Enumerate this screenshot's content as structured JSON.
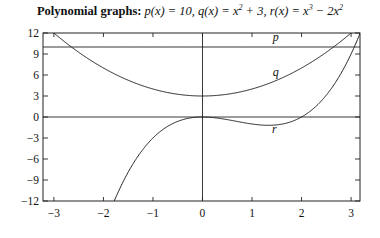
{
  "chart_data": {
    "type": "line",
    "title_bold": "Polynomial graphs:",
    "title_math": "p(x) = 10, q(x) = x² + 3, r(x) = x³ − 2x²",
    "xlabel": "",
    "ylabel": "",
    "xlim": [
      -3.22,
      3.18
    ],
    "ylim": [
      -12,
      12
    ],
    "xticks": [
      -3,
      -2,
      -1,
      0,
      1,
      2,
      3
    ],
    "xtick_labels": [
      "−3",
      "−2",
      "−1",
      "0",
      "1",
      "2",
      "3"
    ],
    "yticks": [
      12,
      9,
      6,
      3,
      0,
      -3,
      -6,
      -9,
      -12
    ],
    "ytick_labels": [
      "12",
      "9",
      "6",
      "3",
      "0",
      "−3",
      "−6",
      "−9",
      "−12"
    ],
    "grid": false,
    "axes_lines": {
      "x0": true,
      "y0": true
    },
    "series": [
      {
        "name": "p",
        "expr": "10",
        "coeffs": [
          10
        ],
        "label_at": [
          1.48,
          10.8
        ]
      },
      {
        "name": "q",
        "expr": "x^2 + 3",
        "coeffs": [
          3,
          0,
          1
        ],
        "label_at": [
          1.48,
          5.8
        ]
      },
      {
        "name": "r",
        "expr": "x^3 - 2x^2",
        "coeffs": [
          0,
          0,
          -2,
          1
        ],
        "label_at": [
          1.45,
          -2.3
        ]
      }
    ],
    "colors": {
      "line": "#222222",
      "axes": "#222222"
    }
  }
}
